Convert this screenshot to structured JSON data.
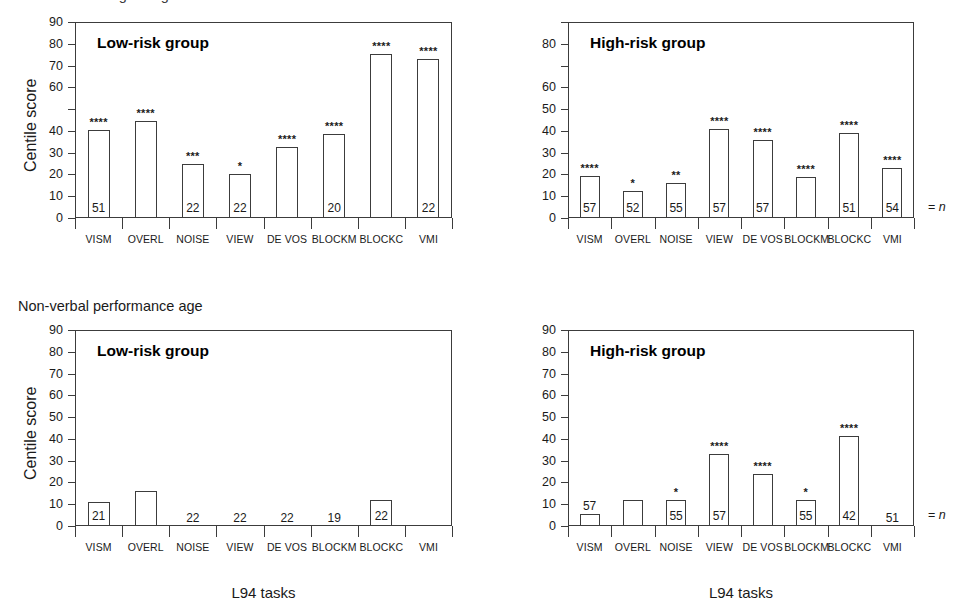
{
  "figure": {
    "clipped_top_text": "Chronological age",
    "section_heading": "Non-verbal performance age",
    "legend_equals_n": "= n",
    "legend_n_symbol": "n",
    "legend_equals": "="
  },
  "axis": {
    "y_title": "Centile score",
    "x_title": "L94 tasks",
    "categories": [
      "VISM",
      "OVERL",
      "NOISE",
      "VIEW",
      "DE VOS",
      "BLOCKM",
      "BLOCKC",
      "VMI"
    ],
    "ylim": [
      0,
      90
    ],
    "yticks": [
      0,
      10,
      20,
      30,
      40,
      50,
      60,
      70,
      80,
      90
    ]
  },
  "chart_data": [
    {
      "id": "top-left",
      "type": "bar",
      "title": "Low-risk group",
      "panel_row": "Chronological age",
      "xlabel": "L94 tasks",
      "ylabel": "Centile score",
      "ylim": [
        0,
        90
      ],
      "yticks": [
        0,
        10,
        20,
        30,
        40,
        50,
        60,
        70,
        80,
        90
      ],
      "ytick_labels": [
        "0",
        "10",
        "20",
        "30",
        "40",
        "",
        "60",
        "70",
        "80",
        "90"
      ],
      "grid": false,
      "legend": "none",
      "categories": [
        "VISM",
        "OVERL",
        "NOISE",
        "VIEW",
        "DE VOS",
        "BLOCKM",
        "BLOCKC",
        "VMI"
      ],
      "values": [
        40.5,
        44.5,
        25,
        20,
        32.5,
        38.5,
        75.5,
        73
      ],
      "significance": [
        "****",
        "****",
        "***",
        "*",
        "****",
        "****",
        "****",
        "****"
      ],
      "n": [
        "51",
        "",
        "22",
        "22",
        "",
        "20",
        "",
        "22"
      ],
      "n_inside_bar": [
        true,
        false,
        true,
        true,
        false,
        true,
        false,
        true
      ]
    },
    {
      "id": "top-right",
      "type": "bar",
      "title": "High-risk group",
      "panel_row": "Chronological age",
      "xlabel": "L94 tasks",
      "ylabel": "Centile score",
      "ylim": [
        0,
        90
      ],
      "yticks": [
        0,
        10,
        20,
        30,
        40,
        50,
        60,
        70,
        80,
        90
      ],
      "ytick_labels": [
        "0",
        "10",
        "20",
        "30",
        "40",
        "50",
        "60",
        "",
        "80",
        ""
      ],
      "grid": false,
      "legend": "none",
      "categories": [
        "VISM",
        "OVERL",
        "NOISE",
        "VIEW",
        "DE VOS",
        "BLOCKM",
        "BLOCKC",
        "VMI"
      ],
      "values": [
        19.5,
        12.5,
        16,
        41,
        36,
        19,
        39,
        23
      ],
      "significance": [
        "****",
        "*",
        "**",
        "****",
        "****",
        "****",
        "****",
        "****"
      ],
      "n": [
        "57",
        "52",
        "55",
        "57",
        "57",
        "",
        "51",
        "54"
      ],
      "n_inside_bar": [
        true,
        true,
        true,
        true,
        true,
        false,
        true,
        true
      ]
    },
    {
      "id": "bottom-left",
      "type": "bar",
      "title": "Low-risk group",
      "panel_row": "Non-verbal performance age",
      "xlabel": "L94 tasks",
      "ylabel": "Centile score",
      "ylim": [
        0,
        90
      ],
      "yticks": [
        0,
        10,
        20,
        30,
        40,
        50,
        60,
        70,
        80,
        90
      ],
      "ytick_labels": [
        "0",
        "10",
        "20",
        "30",
        "40",
        "50",
        "60",
        "70",
        "80",
        "90"
      ],
      "grid": false,
      "legend": "none",
      "categories": [
        "VISM",
        "OVERL",
        "NOISE",
        "VIEW",
        "DE VOS",
        "BLOCKM",
        "BLOCKC",
        "VMI"
      ],
      "values": [
        11,
        16,
        0,
        0,
        0,
        0,
        12,
        0
      ],
      "significance": [
        "",
        "",
        "",
        "",
        "",
        "",
        "",
        ""
      ],
      "n": [
        "21",
        "",
        "22",
        "22",
        "22",
        "19",
        "22",
        ""
      ],
      "n_inside_bar": [
        true,
        false,
        false,
        false,
        false,
        false,
        true,
        false
      ]
    },
    {
      "id": "bottom-right",
      "type": "bar",
      "title": "High-risk group",
      "panel_row": "Non-verbal performance age",
      "xlabel": "L94 tasks",
      "ylabel": "Centile score",
      "ylim": [
        0,
        90
      ],
      "yticks": [
        0,
        10,
        20,
        30,
        40,
        50,
        60,
        70,
        80,
        90
      ],
      "ytick_labels": [
        "0",
        "10",
        "20",
        "30",
        "40",
        "50",
        "60",
        "70",
        "80",
        "90"
      ],
      "grid": false,
      "legend": "none",
      "categories": [
        "VISM",
        "OVERL",
        "NOISE",
        "VIEW",
        "DE VOS",
        "BLOCKM",
        "BLOCKC",
        "VMI"
      ],
      "values": [
        5.5,
        12,
        12,
        33,
        24,
        12,
        41.5,
        0
      ],
      "significance": [
        "",
        "",
        "*",
        "****",
        "****",
        "*",
        "****",
        ""
      ],
      "n": [
        "57",
        "",
        "55",
        "57",
        "",
        "55",
        "42",
        "51"
      ],
      "n_inside_bar": [
        false,
        false,
        true,
        true,
        false,
        true,
        true,
        false
      ]
    }
  ]
}
